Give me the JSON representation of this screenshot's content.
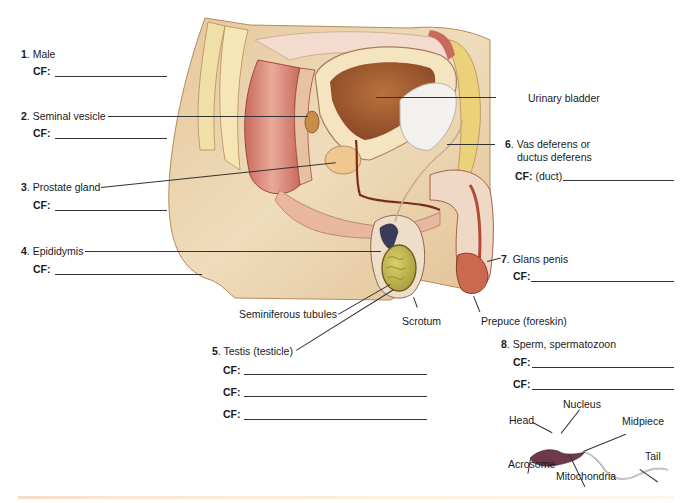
{
  "labels": {
    "item1": {
      "number": "1",
      "text": ". Male",
      "cf": [
        "CF:"
      ]
    },
    "item2": {
      "number": "2",
      "text": ". Seminal vesicle",
      "cf": [
        "CF:"
      ]
    },
    "item3": {
      "number": "3",
      "text": ". Prostate gland",
      "cf": [
        "CF:"
      ]
    },
    "item4": {
      "number": "4",
      "text": ". Epididymis",
      "cf": [
        "CF:"
      ]
    },
    "item5": {
      "number": "5",
      "text": ". Testis (testicle)",
      "cf": [
        "CF:",
        "CF:",
        "CF:"
      ]
    },
    "item6": {
      "number": "6",
      "text_line1": ". Vas deferens or",
      "text_line2": "ductus deferens",
      "cf": [
        "CF:"
      ],
      "cf_hint": "(duct)"
    },
    "item7": {
      "number": "7",
      "text": ". Glans penis",
      "cf": [
        "CF:"
      ]
    },
    "item8": {
      "number": "8",
      "text": ". Sperm, spermatozoon",
      "cf": [
        "CF:",
        "CF:"
      ]
    }
  },
  "unnumbered_labels": {
    "urinary_bladder": "Urinary bladder",
    "seminiferous_tubules": "Seminiferous tubules",
    "scrotum": "Scrotum",
    "prepuce": "Prepuce (foreskin)"
  },
  "sperm_diagram": {
    "nucleus": "Nucleus",
    "head": "Head",
    "midpiece": "Midpiece",
    "tail": "Tail",
    "acrosome": "Acrosome",
    "mitochondria": "Mitochondria"
  },
  "colors": {
    "skin": "#e8cfa6",
    "skin_shadow": "#d6b283",
    "bladder_inner": "#a8643a",
    "muscle": "#c9604a",
    "fat": "#ecd68a",
    "testis": "#c8bd55",
    "line": "#333333"
  }
}
